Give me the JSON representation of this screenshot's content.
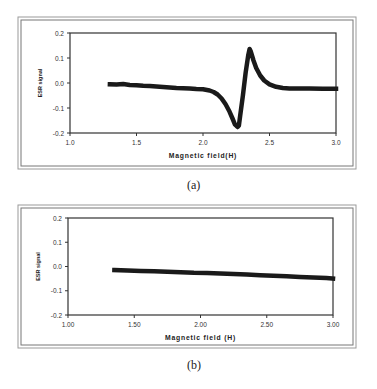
{
  "chart_data": [
    {
      "type": "scatter",
      "panel_label": "(a)",
      "title": "",
      "xlabel": "Magnetic field(H)",
      "ylabel": "ESR signal",
      "xlim": [
        1.0,
        3.0
      ],
      "ylim": [
        -0.2,
        0.2
      ],
      "xticks": [
        "1.0",
        "1.5",
        "2.0",
        "2.5",
        "3.0"
      ],
      "yticks": [
        "0.2",
        "0.1",
        "0.0",
        "-0.1",
        "-0.2"
      ],
      "grid": false,
      "legend": null,
      "series": [
        {
          "name": "ESR signal",
          "x": [
            1.3,
            1.35,
            1.4,
            1.45,
            1.5,
            1.55,
            1.6,
            1.65,
            1.7,
            1.75,
            1.8,
            1.85,
            1.9,
            1.95,
            2.0,
            2.05,
            2.08,
            2.11,
            2.14,
            2.17,
            2.2,
            2.22,
            2.24,
            2.26,
            2.27,
            2.28,
            2.3,
            2.32,
            2.34,
            2.35,
            2.36,
            2.38,
            2.4,
            2.43,
            2.46,
            2.5,
            2.55,
            2.6,
            2.65,
            2.7,
            2.8,
            2.9,
            3.0
          ],
          "y": [
            -0.005,
            -0.006,
            -0.004,
            -0.008,
            -0.009,
            -0.011,
            -0.012,
            -0.014,
            -0.016,
            -0.018,
            -0.02,
            -0.021,
            -0.022,
            -0.024,
            -0.025,
            -0.03,
            -0.036,
            -0.046,
            -0.062,
            -0.085,
            -0.115,
            -0.14,
            -0.165,
            -0.176,
            -0.17,
            -0.13,
            -0.05,
            0.04,
            0.11,
            0.136,
            0.125,
            0.09,
            0.06,
            0.03,
            0.01,
            -0.005,
            -0.015,
            -0.02,
            -0.022,
            -0.022,
            -0.022,
            -0.023,
            -0.023
          ]
        }
      ]
    },
    {
      "type": "scatter",
      "panel_label": "(b)",
      "title": "",
      "xlabel": "Magnetic field (H)",
      "ylabel": "ESR signal",
      "xlim": [
        1.0,
        3.0
      ],
      "ylim": [
        -0.2,
        0.2
      ],
      "xticks": [
        "1.00",
        "1.50",
        "2.00",
        "2.50",
        "3.00"
      ],
      "yticks": [
        "0.2",
        "0.1",
        "0.0",
        "-0.1",
        "-0.2"
      ],
      "grid": false,
      "legend": null,
      "series": [
        {
          "name": "ESR signal",
          "x": [
            1.35,
            1.45,
            1.55,
            1.65,
            1.75,
            1.85,
            1.95,
            2.05,
            2.15,
            2.25,
            2.35,
            2.45,
            2.55,
            2.65,
            2.75,
            2.85,
            2.95,
            3.0
          ],
          "y": [
            -0.015,
            -0.016,
            -0.018,
            -0.02,
            -0.022,
            -0.024,
            -0.026,
            -0.027,
            -0.029,
            -0.031,
            -0.033,
            -0.036,
            -0.038,
            -0.04,
            -0.043,
            -0.045,
            -0.048,
            -0.05
          ]
        }
      ]
    }
  ],
  "captions": {
    "a": "(a)",
    "b": "(b)"
  }
}
